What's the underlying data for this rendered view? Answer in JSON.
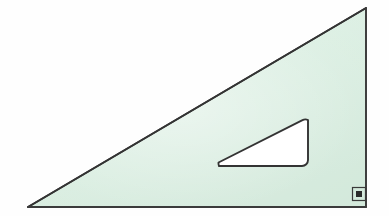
{
  "scene": {
    "title": "Set square (triangular drafting ruler)",
    "description": "A translucent pale-green right-angled set square with a rounded triangular cut-out handle and a small right-angle marker at the square corner.",
    "canvas": {
      "width": 389,
      "height": 216
    },
    "background_color": "#fefefe"
  },
  "colors": {
    "body_fill": "#dcefe3",
    "body_fill_highlight": "#e8f4ec",
    "body_fill_shadow": "#d2e9da",
    "outline": "#3a3a3a",
    "outline_soft": "#5a5a5a",
    "cutout_fill": "#ffffff",
    "marker_dot": "#2b2b2b",
    "background": "#fefefe"
  },
  "geometry": {
    "outer_triangle": {
      "name": "set-square-body",
      "shape": "right-triangle",
      "points": [
        {
          "label": "left-acute-vertex",
          "x": 28,
          "y": 207
        },
        {
          "label": "right-angle-vertex",
          "x": 366,
          "y": 207
        },
        {
          "label": "top-apex-vertex",
          "x": 366,
          "y": 8
        }
      ],
      "stroke_width": 1.8
    },
    "inner_cutout": {
      "name": "handle-cutout",
      "shape": "rounded-right-triangle",
      "points": [
        {
          "label": "cutout-left-vertex",
          "x": 213,
          "y": 166
        },
        {
          "label": "cutout-bottom-right-vertex",
          "x": 308,
          "y": 166
        },
        {
          "label": "cutout-top-right-vertex",
          "x": 308,
          "y": 114
        }
      ],
      "corner_radius": 6,
      "stroke_width": 1.8
    },
    "right_angle_marker": {
      "name": "right-angle-marker",
      "outer_square": {
        "x": 352,
        "y": 187,
        "width": 14,
        "height": 14
      },
      "inner_square": {
        "x": 356,
        "y": 191,
        "width": 6,
        "height": 6
      },
      "stroke_width": 1.2
    }
  },
  "labels": {
    "figure_caption": "Set square",
    "right_angle": "90°"
  }
}
